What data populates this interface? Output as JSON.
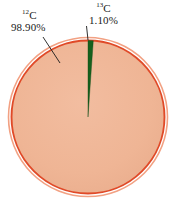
{
  "figure": {
    "type": "pie-chart",
    "background_color": "#ffffff",
    "title": ""
  },
  "chart_data": {
    "type": "pie",
    "title": "",
    "categories": [
      "12C",
      "13C"
    ],
    "values": [
      98.9,
      1.1
    ],
    "labels": [
      "98.90%",
      "1.10%"
    ],
    "units": "percent",
    "total": 100.0,
    "legend": "none",
    "slices": [
      {
        "name": "carbon-12",
        "isotope_mass_number": "12",
        "element_symbol": "C",
        "value": 98.9,
        "value_label": "98.90%",
        "color": "#efb595",
        "start_angle_deg": 3.96,
        "end_angle_deg": 360.0
      },
      {
        "name": "carbon-13",
        "isotope_mass_number": "13",
        "element_symbol": "C",
        "value": 1.1,
        "value_label": "1.10%",
        "color": "#16601d",
        "start_angle_deg": 0.0,
        "end_angle_deg": 3.96
      }
    ]
  },
  "labels": {
    "c12": {
      "mass_number": "12",
      "symbol": "C",
      "percent": "98.90%"
    },
    "c13": {
      "mass_number": "13",
      "symbol": "C",
      "percent": "1.10%"
    }
  },
  "colors": {
    "slice_c12_fill": "#efb595",
    "slice_c13_fill": "#16601d",
    "ring_inner_stroke": "#e04a28",
    "ring_outer_stroke": "#f2a183",
    "leader_line": "#1a1a1a",
    "label_text": "#1a1a1a",
    "background": "#ffffff"
  },
  "geometry": {
    "center_x": 88,
    "center_y": 117,
    "radius": 78,
    "outer_ring_radius": 80
  }
}
